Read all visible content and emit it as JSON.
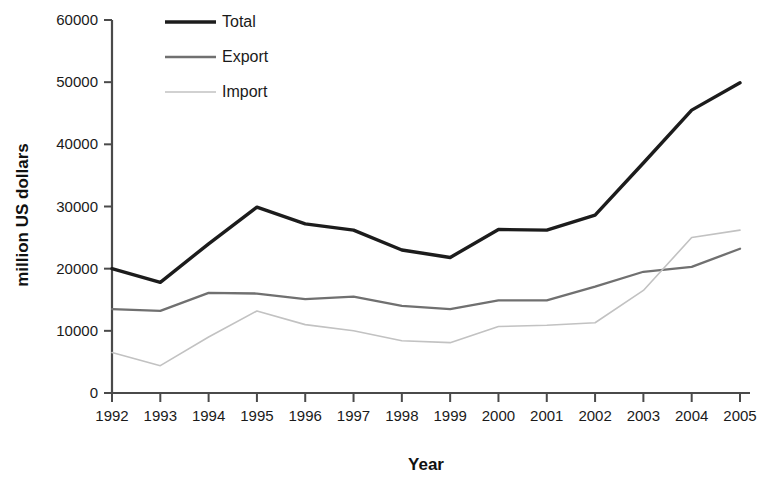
{
  "chart_data": {
    "type": "line",
    "title": "",
    "xlabel": "Year",
    "ylabel": "million US dollars",
    "categories": [
      "1992",
      "1993",
      "1994",
      "1995",
      "1996",
      "1997",
      "1998",
      "1999",
      "2000",
      "2001",
      "2002",
      "2003",
      "2004",
      "2005"
    ],
    "ytick_labels": [
      "0",
      "10000",
      "20000",
      "30000",
      "40000",
      "50000",
      "60000"
    ],
    "ytick_values": [
      0,
      10000,
      20000,
      30000,
      40000,
      50000,
      60000
    ],
    "ylim": [
      0,
      60000
    ],
    "grid": false,
    "legend_position": "top-left-inside",
    "series": [
      {
        "name": "Total",
        "color": "#1c1c1c",
        "width": 3.4,
        "dash": "none",
        "values": [
          20000,
          17800,
          24000,
          29900,
          27200,
          26200,
          23000,
          21800,
          26300,
          26200,
          28600,
          37000,
          45500,
          49900
        ]
      },
      {
        "name": "Export",
        "color": "#707070",
        "width": 2.3,
        "dash": "none",
        "values": [
          13500,
          13200,
          16100,
          16000,
          15100,
          15500,
          14000,
          13500,
          14900,
          14900,
          17100,
          19500,
          20300,
          23200
        ]
      },
      {
        "name": "Import",
        "color": "#c2c2c2",
        "width": 1.6,
        "dash": "none",
        "values": [
          6500,
          4400,
          9000,
          13200,
          11000,
          10000,
          8400,
          8100,
          10700,
          10900,
          11300,
          16500,
          25000,
          26200
        ]
      }
    ]
  },
  "legend": {
    "items": [
      {
        "label": "Total"
      },
      {
        "label": "Export"
      },
      {
        "label": "Import"
      }
    ]
  },
  "axes": {
    "x_title": "Year",
    "y_title": "million US dollars"
  }
}
